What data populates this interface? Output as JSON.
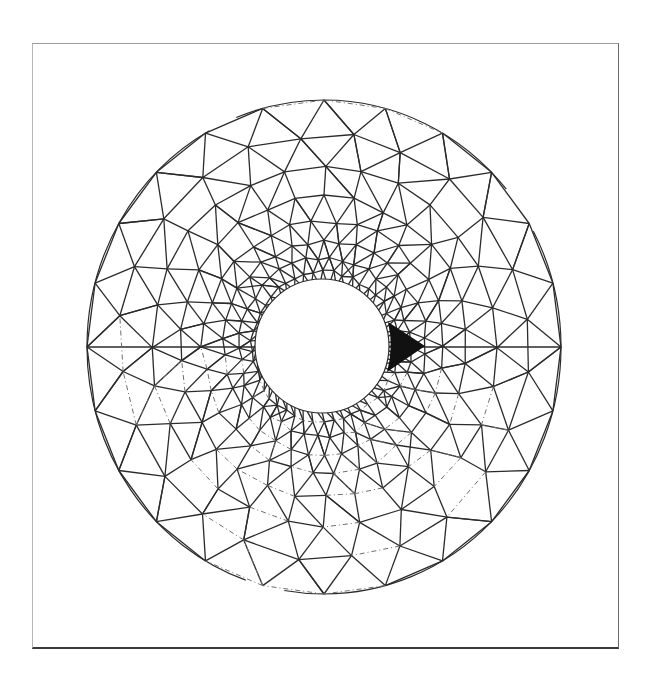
{
  "figure": {
    "frame": {
      "x": 32,
      "y": 43,
      "width": 587,
      "height": 606
    },
    "outer_boundary": {
      "cx": 324,
      "cy": 347,
      "rx": 237,
      "ry": 247
    },
    "inner_hole": {
      "cx": 322,
      "cy": 346,
      "r": 67
    },
    "wedge": {
      "tip": [
        425,
        346
      ],
      "base_top": [
        388,
        322
      ],
      "base_bottom": [
        387,
        372
      ],
      "color": "#111111"
    },
    "line_color": "#2b2b2b",
    "dashed_line_color": "#6e6e6e",
    "rings": [
      {
        "radius_frac": 1.0,
        "nodes": 24
      },
      {
        "radius_frac": 0.86,
        "nodes": 24
      },
      {
        "radius_frac": 0.73,
        "nodes": 28
      },
      {
        "radius_frac": 0.61,
        "nodes": 30
      },
      {
        "radius_frac": 0.51,
        "nodes": 34
      },
      {
        "radius_frac": 0.43,
        "nodes": 38
      },
      {
        "radius_frac": 0.36,
        "nodes": 42
      },
      {
        "radius_frac": 0.305,
        "nodes": 46
      }
    ]
  }
}
